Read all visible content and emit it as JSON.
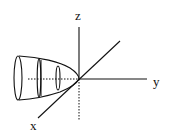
{
  "diagram": {
    "type": "3d-coordinate-axes",
    "axes": {
      "x": {
        "label": "x"
      },
      "y": {
        "label": "y"
      },
      "z": {
        "label": "z"
      }
    },
    "shape": "paraboloid opening toward negative y, vertex at origin, with cross-section rings",
    "colors": {
      "stroke": "#111111",
      "background": "#ffffff"
    }
  }
}
